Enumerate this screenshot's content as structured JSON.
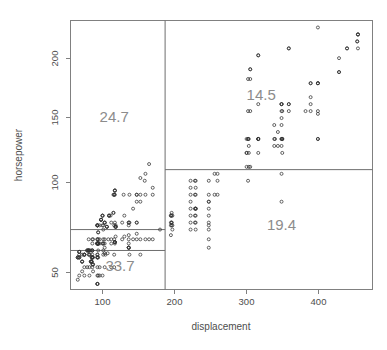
{
  "chart_data": {
    "type": "scatter",
    "title": "",
    "xlabel": "displacement",
    "ylabel": "horsepower",
    "xlim": [
      60,
      475
    ],
    "ylim": [
      42,
      235
    ],
    "xticks": [
      100,
      200,
      300,
      400
    ],
    "yticks": [
      50,
      100,
      150,
      200
    ],
    "grid": false,
    "legend": "none",
    "point_marker": "open-circle",
    "point_color": "#333333",
    "frame_color": "#808080",
    "label_color": "#8c8c8c",
    "partition_lines": {
      "vertical": [
        {
          "x": 190,
          "y_from": 42,
          "y_to": 235
        }
      ],
      "horizontal": [
        {
          "y": 85,
          "x_from": 60,
          "x_to": 190
        },
        {
          "y": 70,
          "x_from": 60,
          "x_to": 190
        },
        {
          "y": 128,
          "x_from": 190,
          "x_to": 475
        }
      ]
    },
    "region_labels": [
      {
        "text": "24.7",
        "x": 120,
        "y": 162
      },
      {
        "text": "33.7",
        "x": 128,
        "y": 55
      },
      {
        "text": "14.5",
        "x": 322,
        "y": 178
      },
      {
        "text": "19.4",
        "x": 350,
        "y": 85
      }
    ],
    "points": [
      [
        307,
        130
      ],
      [
        350,
        165
      ],
      [
        318,
        150
      ],
      [
        304,
        150
      ],
      [
        302,
        140
      ],
      [
        429,
        198
      ],
      [
        454,
        220
      ],
      [
        440,
        215
      ],
      [
        455,
        225
      ],
      [
        390,
        190
      ],
      [
        383,
        170
      ],
      [
        340,
        160
      ],
      [
        400,
        150
      ],
      [
        455,
        225
      ],
      [
        113,
        95
      ],
      [
        198,
        95
      ],
      [
        199,
        97
      ],
      [
        200,
        85
      ],
      [
        97,
        88
      ],
      [
        97,
        46
      ],
      [
        110,
        87
      ],
      [
        107,
        90
      ],
      [
        104,
        95
      ],
      [
        121,
        113
      ],
      [
        199,
        90
      ],
      [
        360,
        215
      ],
      [
        307,
        200
      ],
      [
        318,
        210
      ],
      [
        304,
        193
      ],
      [
        97,
        88
      ],
      [
        140,
        90
      ],
      [
        113,
        95
      ],
      [
        98,
        83
      ],
      [
        232,
        100
      ],
      [
        225,
        105
      ],
      [
        250,
        100
      ],
      [
        198,
        90
      ],
      [
        97,
        88
      ],
      [
        97,
        46
      ],
      [
        110,
        87
      ],
      [
        107,
        90
      ],
      [
        104,
        95
      ],
      [
        121,
        113
      ],
      [
        360,
        175
      ],
      [
        307,
        170
      ],
      [
        318,
        175
      ],
      [
        304,
        170
      ],
      [
        350,
        170
      ],
      [
        400,
        190
      ],
      [
        351,
        150
      ],
      [
        318,
        150
      ],
      [
        400,
        190
      ],
      [
        351,
        150
      ],
      [
        97,
        88
      ],
      [
        140,
        90
      ],
      [
        113,
        95
      ],
      [
        98,
        83
      ],
      [
        121,
        113
      ],
      [
        199,
        90
      ],
      [
        183,
        85
      ],
      [
        232,
        100
      ],
      [
        250,
        105
      ],
      [
        250,
        88
      ],
      [
        198,
        88
      ],
      [
        97,
        88
      ],
      [
        97,
        46
      ],
      [
        110,
        87
      ],
      [
        107,
        90
      ],
      [
        104,
        95
      ],
      [
        107,
        72
      ],
      [
        104,
        75
      ],
      [
        98,
        75
      ],
      [
        97,
        75
      ],
      [
        97,
        75
      ],
      [
        140,
        72
      ],
      [
        121,
        76
      ],
      [
        122,
        87
      ],
      [
        102,
        92
      ],
      [
        98,
        75
      ],
      [
        97,
        75
      ],
      [
        97,
        75
      ],
      [
        140,
        72
      ],
      [
        121,
        76
      ],
      [
        122,
        87
      ],
      [
        102,
        92
      ],
      [
        98,
        75
      ],
      [
        97,
        75
      ],
      [
        97,
        75
      ],
      [
        140,
        72
      ],
      [
        121,
        76
      ],
      [
        122,
        87
      ],
      [
        102,
        92
      ],
      [
        98,
        75
      ],
      [
        97,
        75
      ],
      [
        97,
        75
      ],
      [
        140,
        72
      ],
      [
        121,
        76
      ],
      [
        122,
        87
      ],
      [
        102,
        92
      ],
      [
        108,
        67
      ],
      [
        79,
        67
      ],
      [
        97,
        67
      ],
      [
        72,
        69
      ],
      [
        91,
        60
      ],
      [
        70,
        65
      ],
      [
        76,
        62
      ],
      [
        88,
        62
      ],
      [
        72,
        65
      ],
      [
        97,
        65
      ],
      [
        90,
        65
      ],
      [
        89,
        62
      ],
      [
        83,
        70
      ],
      [
        90,
        70
      ],
      [
        85,
        70
      ],
      [
        97,
        78
      ],
      [
        79,
        67
      ],
      [
        86,
        67
      ],
      [
        72,
        69
      ],
      [
        90,
        60
      ],
      [
        70,
        65
      ],
      [
        76,
        62
      ],
      [
        88,
        62
      ],
      [
        72,
        65
      ],
      [
        97,
        65
      ],
      [
        90,
        65
      ],
      [
        89,
        62
      ],
      [
        83,
        70
      ],
      [
        90,
        70
      ],
      [
        85,
        70
      ],
      [
        119,
        97
      ],
      [
        107,
        75
      ],
      [
        116,
        75
      ],
      [
        79,
        67
      ],
      [
        86,
        67
      ],
      [
        72,
        69
      ],
      [
        91,
        60
      ],
      [
        70,
        65
      ],
      [
        76,
        62
      ],
      [
        88,
        62
      ],
      [
        72,
        65
      ],
      [
        97,
        65
      ],
      [
        90,
        65
      ],
      [
        89,
        62
      ],
      [
        83,
        70
      ],
      [
        90,
        70
      ],
      [
        85,
        70
      ],
      [
        98,
        65
      ],
      [
        115,
        95
      ],
      [
        120,
        88
      ],
      [
        122,
        88
      ],
      [
        116,
        90
      ],
      [
        121,
        90
      ],
      [
        120,
        110
      ],
      [
        119,
        110
      ],
      [
        120,
        110
      ],
      [
        121,
        110
      ],
      [
        141,
        90
      ],
      [
        151,
        90
      ],
      [
        156,
        122
      ],
      [
        156,
        105
      ],
      [
        151,
        105
      ],
      [
        134,
        95
      ],
      [
        133,
        110
      ],
      [
        140,
        88
      ],
      [
        141,
        110
      ],
      [
        151,
        110
      ],
      [
        140,
        81
      ],
      [
        146,
        100
      ],
      [
        151,
        90
      ],
      [
        168,
        132
      ],
      [
        162,
        120
      ],
      [
        163,
        125
      ],
      [
        173,
        115
      ],
      [
        163,
        110
      ],
      [
        156,
        110
      ],
      [
        151,
        110
      ],
      [
        173,
        110
      ],
      [
        131,
        90
      ],
      [
        105,
        88
      ],
      [
        100,
        88
      ],
      [
        104,
        88
      ],
      [
        105,
        85
      ],
      [
        119,
        97
      ],
      [
        105,
        75
      ],
      [
        105,
        75
      ],
      [
        100,
        75
      ],
      [
        98,
        75
      ],
      [
        90,
        75
      ],
      [
        86,
        70
      ],
      [
        85,
        70
      ],
      [
        88,
        70
      ],
      [
        90,
        65
      ],
      [
        91,
        65
      ],
      [
        90,
        65
      ],
      [
        89,
        65
      ],
      [
        98,
        70
      ],
      [
        105,
        70
      ],
      [
        107,
        68
      ],
      [
        111,
        68
      ],
      [
        121,
        75
      ],
      [
        140,
        75
      ],
      [
        151,
        82
      ],
      [
        134,
        80
      ],
      [
        122,
        80
      ],
      [
        116,
        78
      ],
      [
        105,
        78
      ],
      [
        98,
        78
      ],
      [
        90,
        78
      ],
      [
        85,
        78
      ],
      [
        91,
        78
      ],
      [
        97,
        78
      ],
      [
        100,
        78
      ],
      [
        107,
        78
      ],
      [
        112,
        78
      ],
      [
        120,
        78
      ],
      [
        131,
        78
      ],
      [
        140,
        78
      ],
      [
        146,
        78
      ],
      [
        151,
        78
      ],
      [
        156,
        78
      ],
      [
        163,
        78
      ],
      [
        168,
        78
      ],
      [
        173,
        78
      ],
      [
        156,
        67
      ],
      [
        141,
        67
      ],
      [
        120,
        67
      ],
      [
        105,
        67
      ],
      [
        97,
        67
      ],
      [
        90,
        67
      ],
      [
        85,
        67
      ],
      [
        79,
        67
      ],
      [
        76,
        67
      ],
      [
        72,
        67
      ],
      [
        91,
        55
      ],
      [
        97,
        52
      ],
      [
        98,
        52
      ],
      [
        100,
        52
      ],
      [
        104,
        52
      ],
      [
        86,
        52
      ],
      [
        79,
        52
      ],
      [
        72,
        52
      ],
      [
        76,
        55
      ],
      [
        70,
        49
      ],
      [
        83,
        58
      ],
      [
        90,
        58
      ],
      [
        97,
        58
      ],
      [
        100,
        58
      ],
      [
        107,
        58
      ],
      [
        116,
        58
      ],
      [
        120,
        58
      ],
      [
        86,
        58
      ],
      [
        79,
        58
      ],
      [
        225,
        110
      ],
      [
        232,
        110
      ],
      [
        231,
        110
      ],
      [
        250,
        110
      ],
      [
        258,
        110
      ],
      [
        262,
        110
      ],
      [
        250,
        105
      ],
      [
        232,
        100
      ],
      [
        225,
        100
      ],
      [
        231,
        100
      ],
      [
        250,
        95
      ],
      [
        232,
        95
      ],
      [
        225,
        95
      ],
      [
        231,
        95
      ],
      [
        250,
        90
      ],
      [
        232,
        90
      ],
      [
        225,
        90
      ],
      [
        231,
        90
      ],
      [
        250,
        85
      ],
      [
        232,
        85
      ],
      [
        225,
        85
      ],
      [
        250,
        78
      ],
      [
        250,
        72
      ],
      [
        258,
        125
      ],
      [
        262,
        125
      ],
      [
        232,
        115
      ],
      [
        225,
        115
      ],
      [
        231,
        120
      ],
      [
        200,
        95
      ],
      [
        199,
        95
      ],
      [
        198,
        95
      ],
      [
        200,
        88
      ],
      [
        199,
        88
      ],
      [
        198,
        81
      ],
      [
        305,
        130
      ],
      [
        302,
        130
      ],
      [
        305,
        140
      ],
      [
        302,
        140
      ],
      [
        305,
        145
      ],
      [
        318,
        140
      ],
      [
        318,
        150
      ],
      [
        304,
        120
      ],
      [
        350,
        125
      ],
      [
        350,
        105
      ],
      [
        350,
        150
      ],
      [
        351,
        150
      ],
      [
        350,
        175
      ],
      [
        350,
        175
      ],
      [
        351,
        170
      ],
      [
        360,
        175
      ],
      [
        360,
        170
      ],
      [
        350,
        160
      ],
      [
        345,
        155
      ],
      [
        340,
        150
      ],
      [
        341,
        150
      ],
      [
        350,
        150
      ],
      [
        351,
        140
      ],
      [
        350,
        145
      ],
      [
        345,
        145
      ],
      [
        340,
        145
      ],
      [
        400,
        170
      ],
      [
        400,
        168
      ],
      [
        390,
        170
      ],
      [
        390,
        175
      ],
      [
        390,
        180
      ],
      [
        400,
        150
      ],
      [
        400,
        190
      ],
      [
        390,
        190
      ],
      [
        360,
        215
      ],
      [
        400,
        230
      ],
      [
        429,
        198
      ],
      [
        429,
        208
      ],
      [
        440,
        215
      ],
      [
        454,
        220
      ],
      [
        455,
        225
      ],
      [
        455,
        215
      ],
      [
        307,
        193
      ],
      [
        307,
        200
      ],
      [
        318,
        210
      ],
      [
        302,
        150
      ],
      [
        304,
        150
      ],
      [
        318,
        150
      ],
      [
        305,
        150
      ],
      [
        262,
        120
      ],
      [
        250,
        120
      ],
      [
        232,
        120
      ],
      [
        225,
        120
      ],
      [
        350,
        175
      ]
    ]
  },
  "axis": {
    "x_label": "displacement",
    "y_label": "horsepower",
    "x_tick_labels": [
      "100",
      "200",
      "300",
      "400"
    ],
    "y_tick_labels": [
      "50",
      "100",
      "150",
      "200"
    ]
  },
  "regions": {
    "top_left": "24.7",
    "bottom_left": "33.7",
    "top_right": "14.5",
    "bottom_right": "19.4"
  }
}
